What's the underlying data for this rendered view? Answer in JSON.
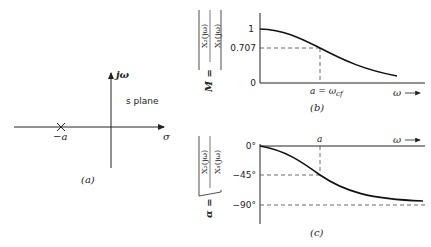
{
  "panel_a": {
    "caption": "(a)",
    "plane_label": "s plane",
    "imag_axis_label": "jω",
    "real_axis_label": "σ",
    "pole_label": "−a",
    "pole_marker": "×"
  },
  "panel_b": {
    "caption": "(b)",
    "ylabel_prefix": "M =",
    "ylabel_num": "X₂(jω)",
    "ylabel_den": "X₁(jω)",
    "ytick_1": "1",
    "ytick_707": "0.707",
    "ytick_0": "0",
    "xmark": "a = ω",
    "xmark_sub": "cf",
    "xaxis_label": "ω"
  },
  "panel_c": {
    "caption": "(c)",
    "ylabel_prefix": "α =",
    "ylabel_num": "X₂(jω)",
    "ylabel_den": "X₁(jω)",
    "ytick_0": "0°",
    "ytick_45": "−45°",
    "ytick_90": "−90°",
    "xmark": "a",
    "xaxis_label": "ω"
  },
  "colors": {
    "ink": "#222222",
    "background": "#ffffff"
  }
}
